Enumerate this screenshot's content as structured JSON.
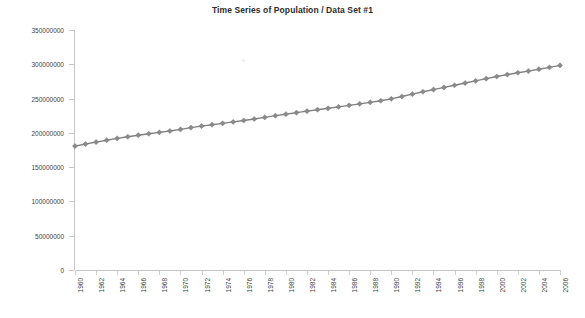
{
  "chart_data": {
    "type": "line",
    "title": "Time Series of Population  /  Data Set #1",
    "xlabel": "",
    "ylabel": "",
    "grid": false,
    "legend": false,
    "legend_position": "none",
    "series_color": "#808080",
    "marker": "diamond",
    "ylim": [
      0,
      350000000
    ],
    "ytick_values": [
      0,
      50000000,
      100000000,
      150000000,
      200000000,
      250000000,
      300000000,
      350000000
    ],
    "ytick_labels": [
      "0",
      "50000000",
      "100000000",
      "150000000",
      "200000000",
      "250000000",
      "300000000",
      "350000000"
    ],
    "xlim": [
      1960,
      2006
    ],
    "xtick_labels": [
      "1960",
      "1962",
      "1964",
      "1966",
      "1968",
      "1970",
      "1972",
      "1974",
      "1976",
      "1978",
      "1980",
      "1982",
      "1984",
      "1986",
      "1988",
      "1990",
      "1992",
      "1994",
      "1996",
      "1998",
      "2000",
      "2002",
      "2004",
      "2006"
    ],
    "categories": [
      1960,
      1961,
      1962,
      1963,
      1964,
      1965,
      1966,
      1967,
      1968,
      1969,
      1970,
      1971,
      1972,
      1973,
      1974,
      1975,
      1976,
      1977,
      1978,
      1979,
      1980,
      1981,
      1982,
      1983,
      1984,
      1985,
      1986,
      1987,
      1988,
      1989,
      1990,
      1991,
      1992,
      1993,
      1994,
      1995,
      1996,
      1997,
      1998,
      1999,
      2000,
      2001,
      2002,
      2003,
      2004,
      2005,
      2006
    ],
    "series": [
      {
        "name": "Population",
        "values": [
          180671000,
          183691000,
          186538000,
          189242000,
          191889000,
          194303000,
          196560000,
          198712000,
          200706000,
          202677000,
          205052000,
          207661000,
          209896000,
          211909000,
          213854000,
          215973000,
          218035000,
          220239000,
          222585000,
          225055000,
          227225000,
          229466000,
          231664000,
          233792000,
          235825000,
          237924000,
          240133000,
          242289000,
          244499000,
          246819000,
          249623000,
          252981000,
          256514000,
          259919000,
          263126000,
          266278000,
          269394000,
          272647000,
          275854000,
          279040000,
          282162000,
          284969000,
          287625000,
          290108000,
          292805000,
          295517000,
          298380000
        ]
      }
    ]
  }
}
